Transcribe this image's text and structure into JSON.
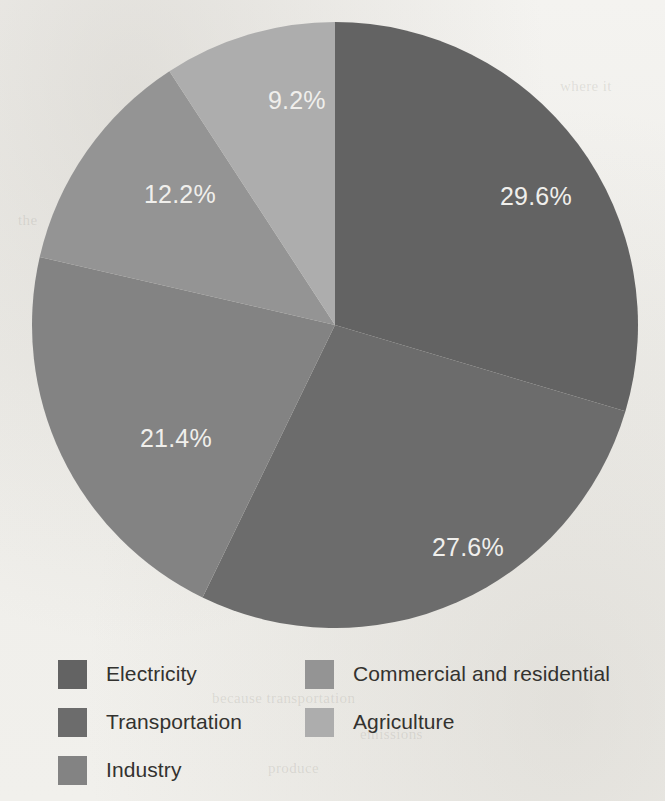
{
  "page": {
    "background_color": "#f2f1ee",
    "bleed_through_fragments": [
      {
        "text": "and emission",
        "x": 300,
        "y": 48
      },
      {
        "text": "where it",
        "x": 560,
        "y": 78
      },
      {
        "text": "the",
        "x": 18,
        "y": 212
      },
      {
        "text": "in",
        "x": 472,
        "y": 242
      },
      {
        "text": "sector",
        "x": 402,
        "y": 556
      },
      {
        "text": "because transportation",
        "x": 212,
        "y": 690
      },
      {
        "text": "emissions",
        "x": 360,
        "y": 726
      },
      {
        "text": "produce",
        "x": 268,
        "y": 760
      }
    ]
  },
  "chart_data": {
    "type": "pie",
    "title": "",
    "labels": [
      "Electricity",
      "Transportation",
      "Industry",
      "Commercial and residential",
      "Agriculture"
    ],
    "values": [
      29.6,
      27.6,
      21.4,
      12.2,
      9.2
    ],
    "value_labels": [
      "29.6%",
      "27.6%",
      "21.4%",
      "12.2%",
      "9.2%"
    ],
    "colors": [
      "#636363",
      "#6c6c6c",
      "#838383",
      "#949494",
      "#adadad"
    ],
    "label_text_color": "#f0efec",
    "start_angle_deg": 0,
    "direction": "clockwise",
    "legend_position": "bottom",
    "legend_columns": 2,
    "units": "percent"
  },
  "pie": {
    "center_x": 303,
    "center_y": 303,
    "radius": 303,
    "slices": [
      {
        "name": "Electricity",
        "value": 29.6,
        "label": "29.6%",
        "color": "#636363",
        "label_x": 468,
        "label_y": 183
      },
      {
        "name": "Transportation",
        "value": 27.6,
        "label": "27.6%",
        "color": "#6c6c6c",
        "label_x": 400,
        "label_y": 534
      },
      {
        "name": "Industry",
        "value": 21.4,
        "label": "21.4%",
        "color": "#838383",
        "label_x": 108,
        "label_y": 425
      },
      {
        "name": "Commercial and residential",
        "value": 12.2,
        "label": "12.2%",
        "color": "#949494",
        "label_x": 112,
        "label_y": 181
      },
      {
        "name": "Agriculture",
        "value": 9.2,
        "label": "9.2%",
        "color": "#adadad",
        "label_x": 236,
        "label_y": 87
      }
    ]
  },
  "legend": {
    "columns": [
      {
        "items": [
          {
            "label": "Electricity",
            "color": "#636363"
          },
          {
            "label": "Transportation",
            "color": "#6c6c6c"
          },
          {
            "label": "Industry",
            "color": "#838383"
          }
        ]
      },
      {
        "items": [
          {
            "label": "Commercial and residential",
            "color": "#949494"
          },
          {
            "label": "Agriculture",
            "color": "#adadad"
          }
        ]
      }
    ]
  }
}
